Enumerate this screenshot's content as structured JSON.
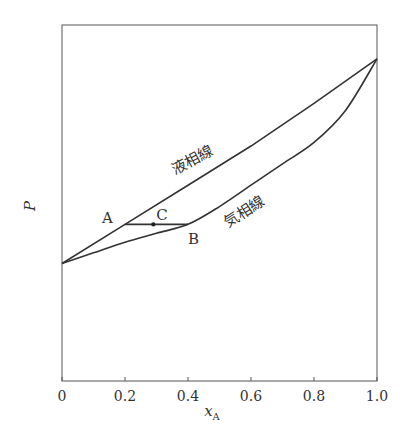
{
  "chart_data": {
    "type": "line",
    "title": "",
    "xlabel": "x_A",
    "xlabel_main": "x",
    "xlabel_sub": "A",
    "ylabel": "P",
    "xlim": [
      0,
      1.0
    ],
    "ylim": [
      0,
      1.0
    ],
    "grid": false,
    "legend": "none",
    "x_ticks": [
      "0",
      "0.2",
      "0.4",
      "0.6",
      "0.8",
      "1.0"
    ],
    "y_ticks": [],
    "series": [
      {
        "name": "液相線",
        "description": "liquid line (straight)",
        "x": [
          0,
          0.2,
          0.4,
          0.6,
          0.8,
          1.0
        ],
        "y": [
          0.33,
          0.44,
          0.55,
          0.66,
          0.78,
          0.905
        ]
      },
      {
        "name": "気相線",
        "description": "vapor line (convex curve)",
        "x": [
          0,
          0.1,
          0.2,
          0.3,
          0.4,
          0.5,
          0.6,
          0.7,
          0.8,
          0.9,
          1.0
        ],
        "y": [
          0.33,
          0.36,
          0.39,
          0.415,
          0.44,
          0.49,
          0.55,
          0.61,
          0.67,
          0.76,
          0.905
        ]
      }
    ],
    "annotations": [
      {
        "label": "A",
        "x": 0.2,
        "y": 0.44
      },
      {
        "label": "B",
        "x": 0.4,
        "y": 0.44
      },
      {
        "label": "C",
        "x": 0.29,
        "y": 0.44,
        "marker": "dot"
      },
      {
        "label": "液相線",
        "note": "label on liquid line"
      },
      {
        "label": "気相線",
        "note": "label on vapor line"
      }
    ],
    "tie_line": {
      "from": "A",
      "to": "B",
      "y": 0.44
    }
  }
}
